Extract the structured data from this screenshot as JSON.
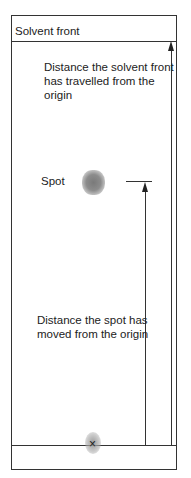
{
  "diagram": {
    "labels": {
      "solvent_front": "Solvent front",
      "solvent_distance_line1": "Distance the solvent front",
      "solvent_distance_line2": "has travelled from the",
      "solvent_distance_line3": "origin",
      "spot": "Spot",
      "spot_distance_line1": "Distance the spot has",
      "spot_distance_line2": "moved from the origin"
    },
    "origin_marker": "×",
    "colors": {
      "line": "#333333",
      "spot": "#808080",
      "background": "#ffffff"
    }
  }
}
